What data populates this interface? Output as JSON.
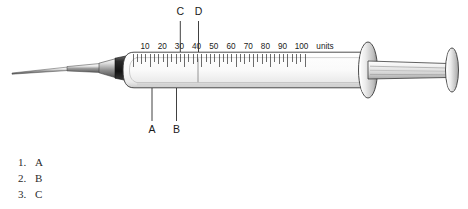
{
  "figure": {
    "device": "insulin-syringe",
    "scale": {
      "unit_label": "units",
      "ticks": [
        "10",
        "20",
        "30",
        "40",
        "50",
        "60",
        "70",
        "80",
        "90",
        "100"
      ],
      "minor_per_major": 2,
      "range": [
        0,
        100
      ]
    },
    "callouts_top": [
      {
        "label": "C",
        "points_to_units": 32
      },
      {
        "label": "D",
        "points_to_units": 42
      }
    ],
    "callouts_bottom": [
      {
        "label": "A",
        "points_to": "barrel-lower-wall"
      },
      {
        "label": "B",
        "points_to": "plunger-tip-inside-barrel"
      }
    ]
  },
  "answers": {
    "items": [
      {
        "num": "1.",
        "letter": "A"
      },
      {
        "num": "2.",
        "letter": "B"
      },
      {
        "num": "3.",
        "letter": "C"
      }
    ]
  },
  "colors": {
    "ink": "#1a1a1a",
    "line": "#333333",
    "metal_light": "#f2f2f2",
    "metal_mid": "#9a9a9a",
    "metal_dark": "#4a4a4a",
    "hub_dark": "#1e1e1e",
    "barrel_fill": "#fbfbfb",
    "text": "#2b2b2b"
  }
}
